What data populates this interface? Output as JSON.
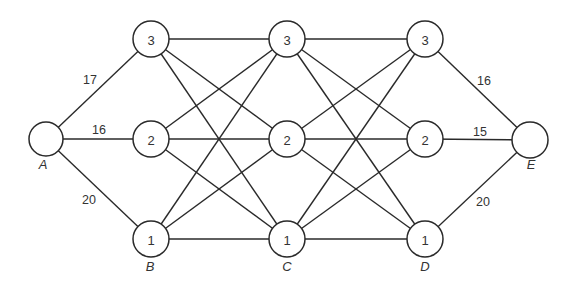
{
  "diagram": {
    "type": "staged network graph",
    "nodes": [
      {
        "id": "A",
        "label": "",
        "x": 46,
        "y": 139,
        "r": 17
      },
      {
        "id": "B3",
        "label": "3",
        "x": 151,
        "y": 39,
        "r": 18
      },
      {
        "id": "B2",
        "label": "2",
        "x": 151,
        "y": 139,
        "r": 18
      },
      {
        "id": "B1",
        "label": "1",
        "x": 151,
        "y": 239,
        "r": 18
      },
      {
        "id": "C3",
        "label": "3",
        "x": 287,
        "y": 39,
        "r": 18
      },
      {
        "id": "C2",
        "label": "2",
        "x": 287,
        "y": 139,
        "r": 18
      },
      {
        "id": "C1",
        "label": "1",
        "x": 287,
        "y": 239,
        "r": 18
      },
      {
        "id": "D3",
        "label": "3",
        "x": 425,
        "y": 39,
        "r": 18
      },
      {
        "id": "D2",
        "label": "2",
        "x": 425,
        "y": 139,
        "r": 18
      },
      {
        "id": "D1",
        "label": "1",
        "x": 425,
        "y": 239,
        "r": 18
      },
      {
        "id": "E",
        "label": "",
        "x": 530,
        "y": 140,
        "r": 18
      }
    ],
    "stage_labels": [
      {
        "text": "A",
        "x": 43,
        "y": 164
      },
      {
        "text": "B",
        "x": 150,
        "y": 266
      },
      {
        "text": "C",
        "x": 287,
        "y": 266
      },
      {
        "text": "D",
        "x": 425,
        "y": 266
      },
      {
        "text": "E",
        "x": 531,
        "y": 164
      }
    ],
    "edges": [
      {
        "from": "A",
        "to": "B3",
        "weight": "17"
      },
      {
        "from": "A",
        "to": "B2",
        "weight": "16"
      },
      {
        "from": "A",
        "to": "B1",
        "weight": "20"
      },
      {
        "from": "B3",
        "to": "C3"
      },
      {
        "from": "B3",
        "to": "C2"
      },
      {
        "from": "B3",
        "to": "C1"
      },
      {
        "from": "B2",
        "to": "C3"
      },
      {
        "from": "B2",
        "to": "C2"
      },
      {
        "from": "B2",
        "to": "C1"
      },
      {
        "from": "B1",
        "to": "C3"
      },
      {
        "from": "B1",
        "to": "C2"
      },
      {
        "from": "B1",
        "to": "C1"
      },
      {
        "from": "C3",
        "to": "D3"
      },
      {
        "from": "C3",
        "to": "D2"
      },
      {
        "from": "C3",
        "to": "D1"
      },
      {
        "from": "C2",
        "to": "D3"
      },
      {
        "from": "C2",
        "to": "D2"
      },
      {
        "from": "C2",
        "to": "D1"
      },
      {
        "from": "C1",
        "to": "D3"
      },
      {
        "from": "C1",
        "to": "D2"
      },
      {
        "from": "C1",
        "to": "D1"
      },
      {
        "from": "D3",
        "to": "E",
        "weight": "16"
      },
      {
        "from": "D2",
        "to": "E",
        "weight": "15"
      },
      {
        "from": "D1",
        "to": "E",
        "weight": "20"
      }
    ],
    "weight_labels": [
      {
        "text": "17",
        "x": 90,
        "y": 80
      },
      {
        "text": "16",
        "x": 99,
        "y": 130
      },
      {
        "text": "20",
        "x": 89,
        "y": 200
      },
      {
        "text": "16",
        "x": 484,
        "y": 81
      },
      {
        "text": "15",
        "x": 480,
        "y": 132
      },
      {
        "text": "20",
        "x": 483,
        "y": 202
      }
    ]
  }
}
